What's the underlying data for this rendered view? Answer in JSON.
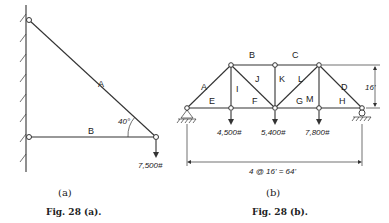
{
  "figure_a": {
    "members": [
      {
        "label": "A"
      },
      {
        "label": "B"
      }
    ],
    "angle_label": "40°",
    "load_label": "7,500#",
    "subcaption": "(a)",
    "caption": "Fig. 28 (a)."
  },
  "figure_b": {
    "top_labels": [
      "B",
      "C"
    ],
    "side_labels": [
      "A",
      "D"
    ],
    "panel_labels": [
      "I",
      "J",
      "K",
      "L",
      "M"
    ],
    "bottom_labels": [
      "E",
      "F",
      "G",
      "H"
    ],
    "loads": [
      "4,500#",
      "5,400#",
      "7,800#"
    ],
    "height_label": "16'",
    "span_label": "4 @ 16' = 64'",
    "subcaption": "(b)",
    "caption": "Fig. 28 (b)."
  }
}
